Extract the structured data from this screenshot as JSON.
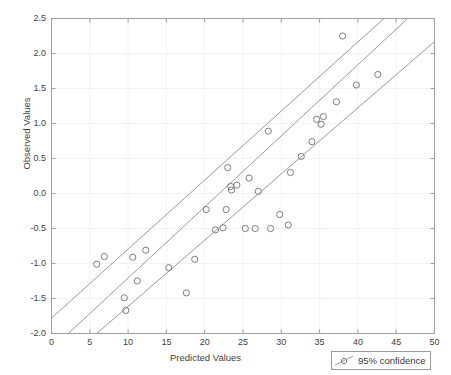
{
  "chart_data": {
    "type": "scatter",
    "title": "",
    "xlabel": "Predicted Values",
    "ylabel": "Observed Values",
    "xlim": [
      0,
      50
    ],
    "ylim": [
      -2.0,
      2.5
    ],
    "xticks": [
      0,
      5,
      10,
      15,
      20,
      25,
      30,
      35,
      40,
      45,
      50
    ],
    "yticks": [
      -2.0,
      -1.5,
      -1.0,
      -0.5,
      0.0,
      0.5,
      1.0,
      1.5,
      2.0,
      2.5
    ],
    "xticklabels": [
      "0",
      "5",
      "10",
      "15",
      "20",
      "25",
      "30",
      "35",
      "40",
      "45",
      "50"
    ],
    "yticklabels": [
      "-2.0",
      "-1.5",
      "-1.0",
      "-0.5",
      "0.0",
      "0.5",
      "1.0",
      "1.5",
      "2.0",
      "2.5"
    ],
    "grid": true,
    "legend": {
      "position": "bottom-right-outside",
      "entries": [
        {
          "label": "95% confidence",
          "marker": "circle",
          "color": "#8a8a8a"
        }
      ]
    },
    "series": [
      {
        "name": "observations",
        "type": "scatter",
        "marker": "open-circle",
        "color": "#7d7d7d",
        "points": [
          [
            5.9,
            -1.01
          ],
          [
            6.9,
            -0.9
          ],
          [
            9.5,
            -1.49
          ],
          [
            9.7,
            -1.67
          ],
          [
            10.6,
            -0.91
          ],
          [
            11.2,
            -1.25
          ],
          [
            12.3,
            -0.81
          ],
          [
            15.3,
            -1.06
          ],
          [
            17.6,
            -1.42
          ],
          [
            18.7,
            -0.94
          ],
          [
            20.2,
            -0.23
          ],
          [
            21.4,
            -0.52
          ],
          [
            22.4,
            -0.49
          ],
          [
            22.8,
            -0.23
          ],
          [
            23.0,
            0.37
          ],
          [
            23.4,
            0.1
          ],
          [
            23.5,
            0.05
          ],
          [
            24.2,
            0.12
          ],
          [
            25.3,
            -0.5
          ],
          [
            25.8,
            0.22
          ],
          [
            26.6,
            -0.5
          ],
          [
            27.0,
            0.03
          ],
          [
            28.3,
            0.89
          ],
          [
            28.6,
            -0.5
          ],
          [
            29.8,
            -0.3
          ],
          [
            30.9,
            -0.45
          ],
          [
            31.2,
            0.3
          ],
          [
            32.6,
            0.53
          ],
          [
            34.0,
            0.74
          ],
          [
            34.6,
            1.06
          ],
          [
            35.2,
            0.99
          ],
          [
            35.5,
            1.1
          ],
          [
            37.2,
            1.31
          ],
          [
            38.0,
            2.25
          ],
          [
            39.8,
            1.55
          ],
          [
            42.6,
            1.7
          ]
        ]
      },
      {
        "name": "regression-fit",
        "type": "line",
        "color": "#9a9a9a",
        "endpoints": [
          [
            2.2,
            -2.0
          ],
          [
            46.5,
            2.5
          ]
        ]
      },
      {
        "name": "confidence-upper",
        "type": "line",
        "color": "#9a9a9a",
        "endpoints": [
          [
            0.0,
            -1.78
          ],
          [
            43.4,
            2.5
          ]
        ]
      },
      {
        "name": "confidence-lower",
        "type": "line",
        "color": "#9a9a9a",
        "endpoints": [
          [
            5.9,
            -2.0
          ],
          [
            50.0,
            2.17
          ]
        ]
      }
    ]
  },
  "axes": {
    "ylabel": "Observed Values",
    "xlabel": "Predicted Values"
  },
  "legend": {
    "label": "95% confidence"
  }
}
